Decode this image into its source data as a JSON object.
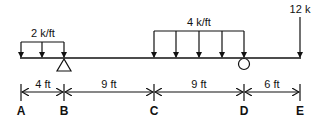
{
  "diagram": {
    "type": "beam-loading",
    "loads": {
      "distributed_left": {
        "label": "2 k/ft",
        "from": "A",
        "to": "B"
      },
      "distributed_mid": {
        "label": "4 k/ft",
        "from": "C",
        "to": "D"
      },
      "point_load": {
        "label": "12 k",
        "at": "E"
      }
    },
    "supports": {
      "pin": {
        "at": "B",
        "shape": "triangle"
      },
      "roller": {
        "at": "D",
        "shape": "circle"
      }
    },
    "dimensions": [
      {
        "label": "4 ft",
        "from": "A",
        "to": "B"
      },
      {
        "label": "9 ft",
        "from": "B",
        "to": "C"
      },
      {
        "label": "9 ft",
        "from": "C",
        "to": "D"
      },
      {
        "label": "6 ft",
        "from": "D",
        "to": "E"
      }
    ],
    "points": [
      "A",
      "B",
      "C",
      "D",
      "E"
    ]
  }
}
